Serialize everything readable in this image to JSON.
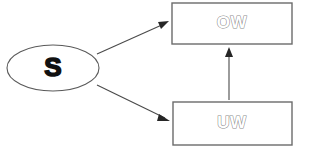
{
  "diagram": {
    "type": "flow-diagram",
    "background_color": "#ffffff",
    "nodes": [
      {
        "id": "source",
        "label": "S",
        "shape": "ellipse",
        "label_style": "solid-bold",
        "cx": 53,
        "cy": 68,
        "rx": 46,
        "ry": 23,
        "stroke_color": "#5a5a5a",
        "fill_color": "#ffffff",
        "text_color": "#111111"
      },
      {
        "id": "ow",
        "label": "OW",
        "shape": "rectangle",
        "label_style": "outline",
        "x": 172,
        "y": 3,
        "width": 120,
        "height": 41,
        "stroke_color": "#6b6b6b",
        "fill_color": "#ffffff",
        "text_color": "#8a8a8a"
      },
      {
        "id": "uw",
        "label": "UW",
        "shape": "rectangle",
        "label_style": "outline",
        "x": 173,
        "y": 102,
        "width": 119,
        "height": 43,
        "stroke_color": "#6b6b6b",
        "fill_color": "#ffffff",
        "text_color": "#8a8a8a"
      }
    ],
    "edges": [
      {
        "id": "source-to-ow",
        "from": "source",
        "to": "ow",
        "direction": "up-right",
        "arrow": "end",
        "x1": 97,
        "y1": 54,
        "x2": 168,
        "y2": 22,
        "stroke_color": "#4a4a4a"
      },
      {
        "id": "source-to-uw",
        "from": "source",
        "to": "uw",
        "direction": "down-right",
        "arrow": "end",
        "x1": 97,
        "y1": 85,
        "x2": 169,
        "y2": 120,
        "stroke_color": "#4a4a4a"
      },
      {
        "id": "uw-to-ow",
        "from": "uw",
        "to": "ow",
        "direction": "up",
        "arrow": "end",
        "x1": 229,
        "y1": 100,
        "x2": 229,
        "y2": 50,
        "stroke_color": "#4a4a4a"
      }
    ]
  }
}
